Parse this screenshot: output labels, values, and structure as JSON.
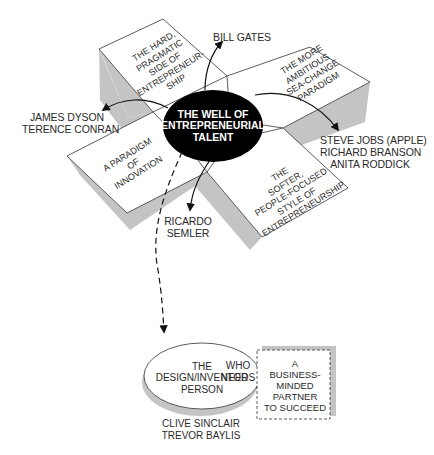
{
  "diagram": {
    "center": {
      "lines": [
        "THE WELL OF",
        "ENTREPRENEURIAL",
        "TALENT"
      ]
    },
    "faces": [
      {
        "id": "hard-pragmatic",
        "lines": [
          "THE HARD,",
          "PRAGMATIC",
          "SIDE OF",
          "ENTREPRENEUR-",
          "SHIP"
        ]
      },
      {
        "id": "ambitious",
        "lines": [
          "THE MORE",
          "AMBITIOUS",
          "SEA-CHANGE",
          "PARADIGM"
        ]
      },
      {
        "id": "innovation",
        "lines": [
          "A PARADIGM",
          "OF",
          "INNOVATION"
        ]
      },
      {
        "id": "softer",
        "lines": [
          "THE",
          "SOFTER,",
          "PEOPLE-FOCUSED",
          "STYLE OF",
          "ENTREPRENEURSHIP"
        ]
      }
    ],
    "people": {
      "top": [
        "BILL GATES"
      ],
      "left": [
        "JAMES DYSON",
        "TERENCE CONRAN"
      ],
      "right": [
        "STEVE JOBS (APPLE)",
        "RICHARD BRANSON",
        "ANITA RODDICK"
      ],
      "bottom": [
        "RICARDO",
        "SEMLER"
      ]
    },
    "design_person": {
      "lines": [
        "THE",
        "DESIGN/INVENTOR",
        "PERSON"
      ],
      "examples": [
        "CLIVE SINCLAIR",
        "TREVOR BAYLIS"
      ]
    },
    "connector": {
      "lines": [
        "WHO",
        "NEEDS"
      ]
    },
    "partner": {
      "lines": [
        "A",
        "BUSINESS-",
        "MINDED",
        "PARTNER",
        "TO SUCCEED"
      ]
    },
    "colors": {
      "shadow": "#c4c4c4",
      "outline": "#333333",
      "center_fill": "#000000",
      "center_text": "#ffffff",
      "face_fill": "#ffffff"
    }
  }
}
